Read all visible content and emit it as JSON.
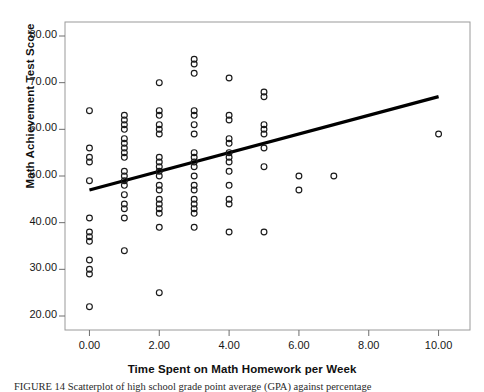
{
  "figure": {
    "caption": "FIGURE 14   Scatterplot of high school grade point average (GPA) against percentage"
  },
  "chart_data": {
    "type": "scatter",
    "title": "",
    "xlabel": "Time Spent on Math Homework per Week",
    "ylabel": "Math Achievement Test Score",
    "xlim": [
      -0.7,
      10.9
    ],
    "ylim": [
      17.0,
      83.0
    ],
    "xticks": [
      "0.00",
      "2.00",
      "4.00",
      "6.00",
      "8.00",
      "10.00"
    ],
    "xtick_values": [
      0,
      2,
      4,
      6,
      8,
      10
    ],
    "yticks": [
      "20.00",
      "30.00",
      "40.00",
      "50.00",
      "60.00",
      "70.00",
      "80.00"
    ],
    "ytick_values": [
      20,
      30,
      40,
      50,
      60,
      70,
      80
    ],
    "grid": false,
    "legend": "none",
    "marker": "open-circle",
    "marker_color": "#1a1a1a",
    "line_color": "#000000",
    "fit_line": {
      "label": "linear regression fit",
      "x": [
        0.0,
        10.0
      ],
      "y": [
        47.0,
        67.0
      ],
      "slope": 2.0,
      "intercept": 47.0
    },
    "points": [
      {
        "x": 0,
        "y": 64
      },
      {
        "x": 0,
        "y": 56
      },
      {
        "x": 0,
        "y": 54
      },
      {
        "x": 0,
        "y": 53
      },
      {
        "x": 0,
        "y": 49
      },
      {
        "x": 0,
        "y": 41
      },
      {
        "x": 0,
        "y": 38
      },
      {
        "x": 0,
        "y": 37
      },
      {
        "x": 0,
        "y": 36
      },
      {
        "x": 0,
        "y": 32
      },
      {
        "x": 0,
        "y": 30
      },
      {
        "x": 0,
        "y": 29
      },
      {
        "x": 0,
        "y": 22
      },
      {
        "x": 1,
        "y": 63
      },
      {
        "x": 1,
        "y": 62
      },
      {
        "x": 1,
        "y": 61
      },
      {
        "x": 1,
        "y": 60
      },
      {
        "x": 1,
        "y": 58
      },
      {
        "x": 1,
        "y": 57
      },
      {
        "x": 1,
        "y": 56
      },
      {
        "x": 1,
        "y": 55
      },
      {
        "x": 1,
        "y": 54
      },
      {
        "x": 1,
        "y": 51
      },
      {
        "x": 1,
        "y": 50
      },
      {
        "x": 1,
        "y": 49
      },
      {
        "x": 1,
        "y": 48
      },
      {
        "x": 1,
        "y": 46
      },
      {
        "x": 1,
        "y": 44
      },
      {
        "x": 1,
        "y": 43
      },
      {
        "x": 1,
        "y": 41
      },
      {
        "x": 1,
        "y": 34
      },
      {
        "x": 2,
        "y": 70
      },
      {
        "x": 2,
        "y": 64
      },
      {
        "x": 2,
        "y": 63
      },
      {
        "x": 2,
        "y": 61
      },
      {
        "x": 2,
        "y": 60
      },
      {
        "x": 2,
        "y": 59
      },
      {
        "x": 2,
        "y": 54
      },
      {
        "x": 2,
        "y": 53
      },
      {
        "x": 2,
        "y": 52
      },
      {
        "x": 2,
        "y": 51
      },
      {
        "x": 2,
        "y": 50
      },
      {
        "x": 2,
        "y": 48
      },
      {
        "x": 2,
        "y": 47
      },
      {
        "x": 2,
        "y": 45
      },
      {
        "x": 2,
        "y": 44
      },
      {
        "x": 2,
        "y": 43
      },
      {
        "x": 2,
        "y": 42
      },
      {
        "x": 2,
        "y": 39
      },
      {
        "x": 2,
        "y": 25
      },
      {
        "x": 3,
        "y": 75
      },
      {
        "x": 3,
        "y": 74
      },
      {
        "x": 3,
        "y": 72
      },
      {
        "x": 3,
        "y": 64
      },
      {
        "x": 3,
        "y": 63
      },
      {
        "x": 3,
        "y": 61
      },
      {
        "x": 3,
        "y": 59
      },
      {
        "x": 3,
        "y": 55
      },
      {
        "x": 3,
        "y": 54
      },
      {
        "x": 3,
        "y": 53
      },
      {
        "x": 3,
        "y": 52
      },
      {
        "x": 3,
        "y": 50
      },
      {
        "x": 3,
        "y": 48
      },
      {
        "x": 3,
        "y": 47
      },
      {
        "x": 3,
        "y": 45
      },
      {
        "x": 3,
        "y": 44
      },
      {
        "x": 3,
        "y": 43
      },
      {
        "x": 3,
        "y": 42
      },
      {
        "x": 3,
        "y": 39
      },
      {
        "x": 4,
        "y": 71
      },
      {
        "x": 4,
        "y": 63
      },
      {
        "x": 4,
        "y": 62
      },
      {
        "x": 4,
        "y": 58
      },
      {
        "x": 4,
        "y": 57
      },
      {
        "x": 4,
        "y": 55
      },
      {
        "x": 4,
        "y": 54
      },
      {
        "x": 4,
        "y": 53
      },
      {
        "x": 4,
        "y": 51
      },
      {
        "x": 4,
        "y": 48
      },
      {
        "x": 4,
        "y": 45
      },
      {
        "x": 4,
        "y": 44
      },
      {
        "x": 4,
        "y": 38
      },
      {
        "x": 5,
        "y": 68
      },
      {
        "x": 5,
        "y": 67
      },
      {
        "x": 5,
        "y": 61
      },
      {
        "x": 5,
        "y": 60
      },
      {
        "x": 5,
        "y": 59
      },
      {
        "x": 5,
        "y": 56
      },
      {
        "x": 5,
        "y": 52
      },
      {
        "x": 5,
        "y": 38
      },
      {
        "x": 6,
        "y": 50
      },
      {
        "x": 6,
        "y": 47
      },
      {
        "x": 7,
        "y": 50
      },
      {
        "x": 10,
        "y": 59
      }
    ]
  }
}
